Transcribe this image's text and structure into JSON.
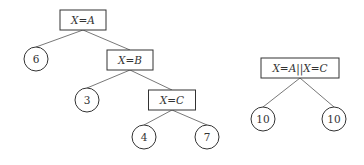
{
  "trees": [
    {
      "name": "left-tree",
      "nodes": [
        {
          "id": "n1",
          "type": "test",
          "label": "X=A"
        },
        {
          "id": "n2",
          "type": "leaf",
          "label": "6"
        },
        {
          "id": "n3",
          "type": "test",
          "label": "X=B"
        },
        {
          "id": "n4",
          "type": "leaf",
          "label": "3"
        },
        {
          "id": "n5",
          "type": "test",
          "label": "X=C"
        },
        {
          "id": "n6",
          "type": "leaf",
          "label": "4"
        },
        {
          "id": "n7",
          "type": "leaf",
          "label": "7"
        }
      ],
      "edges": [
        [
          "n1",
          "n2"
        ],
        [
          "n1",
          "n3"
        ],
        [
          "n3",
          "n4"
        ],
        [
          "n3",
          "n5"
        ],
        [
          "n5",
          "n6"
        ],
        [
          "n5",
          "n7"
        ]
      ]
    },
    {
      "name": "right-tree",
      "nodes": [
        {
          "id": "m1",
          "type": "test",
          "label": "X=A||X=C"
        },
        {
          "id": "m2",
          "type": "leaf",
          "label": "10"
        },
        {
          "id": "m3",
          "type": "leaf",
          "label": "10"
        }
      ],
      "edges": [
        [
          "m1",
          "m2"
        ],
        [
          "m1",
          "m3"
        ]
      ]
    }
  ]
}
